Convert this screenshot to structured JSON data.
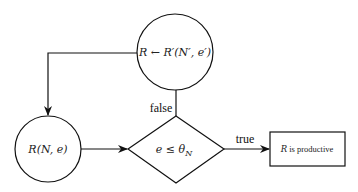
{
  "diagram": {
    "nodes": {
      "update": {
        "label": "R ← R′(N′, e′)",
        "shape": "circle"
      },
      "start": {
        "label": "R(N, e)",
        "shape": "circle"
      },
      "decision": {
        "label": "e ≤ θ",
        "subscript": "N",
        "shape": "diamond"
      },
      "result": {
        "label_math": "R",
        "label_text": " is productive",
        "shape": "rectangle"
      }
    },
    "edges": {
      "false_label": "false",
      "true_label": "true"
    },
    "colors": {
      "stroke": "#111111",
      "background": "#ffffff"
    }
  }
}
